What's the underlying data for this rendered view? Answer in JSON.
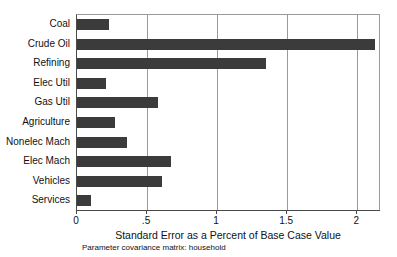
{
  "chart_data": {
    "type": "bar",
    "orientation": "horizontal",
    "title": "",
    "subtitle": "Parameter covariance matrix: household",
    "xlabel": "Standard Error as a Percent of Base Case Value",
    "ylabel": "",
    "categories": [
      "Coal",
      "Crude Oil",
      "Refining",
      "Elec Util",
      "Gas Util",
      "Agriculture",
      "Nonelec Mach",
      "Elec Mach",
      "Vehicles",
      "Services"
    ],
    "values": [
      0.23,
      2.13,
      1.35,
      0.21,
      0.58,
      0.27,
      0.36,
      0.67,
      0.61,
      0.1
    ],
    "xlim": [
      0,
      2.17
    ],
    "xticks": [
      0,
      0.5,
      1,
      1.5,
      2
    ],
    "xtick_labels": [
      "0",
      ".5",
      "1",
      "1.5",
      "2"
    ],
    "grid": "vertical",
    "legend": "none",
    "bar_color": "#3b3b3b",
    "axis_color": "#4a4a4a",
    "grid_color": "#9a9a9a",
    "background": "#ffffff"
  }
}
